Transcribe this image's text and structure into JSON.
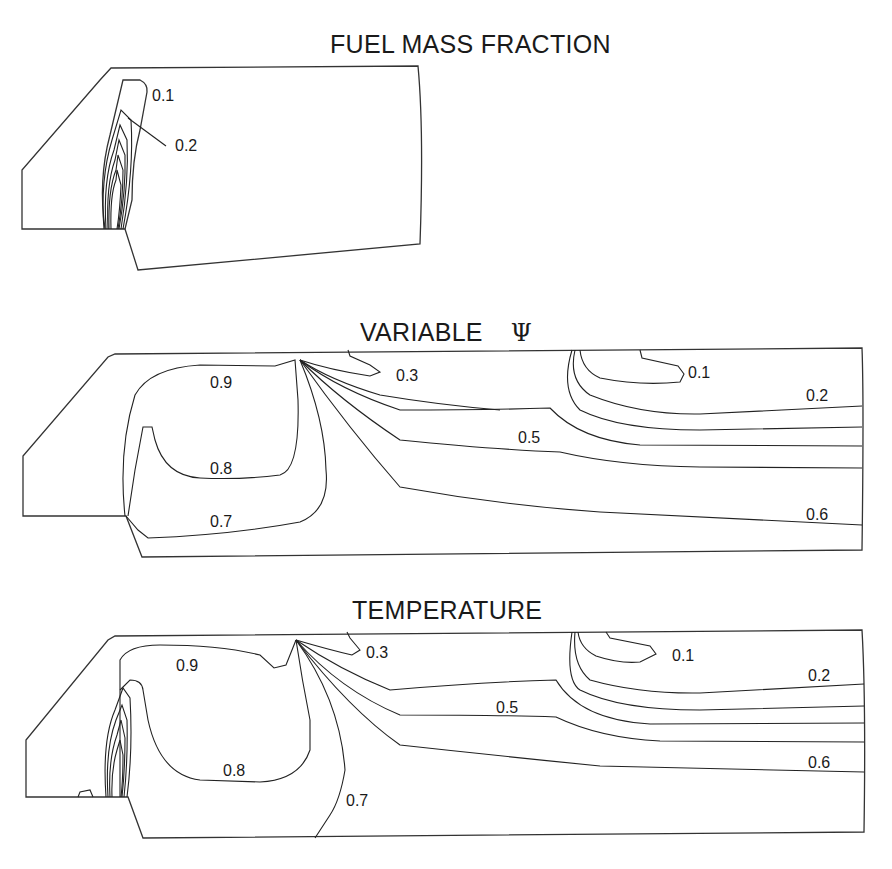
{
  "panels": [
    {
      "title": "FUEL MASS FRACTION",
      "labels": [
        "0.1",
        "0.2"
      ]
    },
    {
      "title": "VARIABLE",
      "symbol": "Ψ",
      "labels": [
        "0.9",
        "0.3",
        "0.1",
        "0.2",
        "0.5",
        "0.8",
        "0.7",
        "0.6"
      ]
    },
    {
      "title": "TEMPERATURE",
      "labels": [
        "0.9",
        "0.3",
        "0.1",
        "0.2",
        "0.5",
        "0.8",
        "0.7",
        "0.6"
      ]
    }
  ],
  "colors": {
    "line": "#222222",
    "background": "#ffffff"
  }
}
